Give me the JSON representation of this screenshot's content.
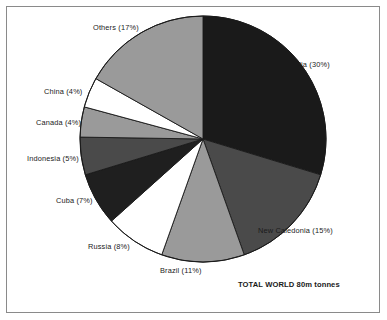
{
  "chart_data": {
    "type": "pie",
    "title": "",
    "subtitle": "",
    "annotation": "TOTAL WORLD 80m tonnes",
    "total_label": "TOTAL WORLD 80m tonnes",
    "total_value": 80,
    "total_units": "m tonnes",
    "start_angle_deg": 0,
    "direction": "clockwise",
    "legend_position": "outside-labels",
    "grid": false,
    "categories": [
      "Australia",
      "New Caledonia",
      "Brazil",
      "Russia",
      "Cuba",
      "Indonesia",
      "Canada",
      "China",
      "Others"
    ],
    "values": [
      30,
      15,
      11,
      8,
      7,
      5,
      4,
      4,
      17
    ],
    "units": "percent",
    "slices": [
      {
        "name": "Australia",
        "value": 30,
        "label": "Australia (30%)",
        "color": "#1a1a1a"
      },
      {
        "name": "New Caledonia",
        "value": 15,
        "label": "New Caledonia (15%)",
        "color": "#4a4a4a"
      },
      {
        "name": "Brazil",
        "value": 11,
        "label": "Brazil (11%)",
        "color": "#9a9a9a"
      },
      {
        "name": "Russia",
        "value": 8,
        "label": "Russia (8%)",
        "color": "#ffffff"
      },
      {
        "name": "Cuba",
        "value": 7,
        "label": "Cuba (7%)",
        "color": "#1f1f1f"
      },
      {
        "name": "Indonesia",
        "value": 5,
        "label": "Indonesia (5%)",
        "color": "#4a4a4a"
      },
      {
        "name": "Canada",
        "value": 4,
        "label": "Canada (4%)",
        "color": "#9a9a9a"
      },
      {
        "name": "China",
        "value": 4,
        "label": "China (4%)",
        "color": "#ffffff"
      },
      {
        "name": "Others",
        "value": 17,
        "label": "Others (17%)",
        "color": "#9a9a9a"
      }
    ]
  },
  "labels": {
    "australia": "Australia (30%)",
    "new_caledonia": "New Caledonia (15%)",
    "brazil": "Brazil (11%)",
    "russia": "Russia (8%)",
    "cuba": "Cuba (7%)",
    "indonesia": "Indonesia (5%)",
    "canada": "Canada (4%)",
    "china": "China (4%)",
    "others": "Others (17%)"
  },
  "caption": {
    "total": "TOTAL WORLD 80m tonnes"
  },
  "colors": {
    "outline": "#1a1a1a",
    "frame": "#8a8a8a",
    "background": "#ffffff",
    "dark": "#1a1a1a",
    "mid_dark": "#4a4a4a",
    "light_mid": "#9a9a9a",
    "white": "#ffffff"
  }
}
